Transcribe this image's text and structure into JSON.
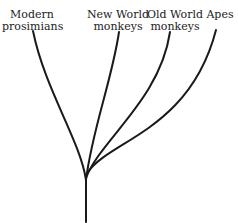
{
  "diagram": {
    "type": "phylogenetic-tree",
    "labels": [
      {
        "line1": "Modern",
        "line2": "prosimians"
      },
      {
        "line1": "New World",
        "line2": "monkeys"
      },
      {
        "line1": "Old World",
        "line2": "monkeys"
      },
      {
        "line1": "",
        "line2": "Apes"
      }
    ],
    "line_color": "#1a1a1a"
  }
}
